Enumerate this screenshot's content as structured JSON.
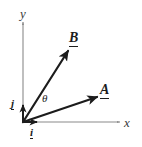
{
  "figure": {
    "width": 142,
    "height": 147,
    "background_color": "#ffffff"
  },
  "axes": {
    "origin": {
      "x": 23,
      "y": 122
    },
    "x_axis": {
      "label": "x",
      "color": "#8a8a8a",
      "from": {
        "x": 23,
        "y": 122
      },
      "to": {
        "x": 120,
        "y": 122
      }
    },
    "y_axis": {
      "label": "y",
      "color": "#8a8a8a",
      "from": {
        "x": 23,
        "y": 122
      },
      "to": {
        "x": 23,
        "y": 22
      }
    }
  },
  "vectors": [
    {
      "name": "A",
      "label": "A",
      "color": "#1c1c1c",
      "from": {
        "x": 23,
        "y": 122
      },
      "to": {
        "x": 97,
        "y": 97
      },
      "angle_from_x_deg": 18.6,
      "style": "bold-underlined"
    },
    {
      "name": "B",
      "label": "B",
      "color": "#1c1c1c",
      "from": {
        "x": 23,
        "y": 122
      },
      "to": {
        "x": 68,
        "y": 50
      },
      "angle_from_x_deg": 58.0,
      "style": "bold-underlined"
    }
  ],
  "unit_vectors": [
    {
      "name": "i",
      "label": "i",
      "color": "#1c1c1c",
      "from": {
        "x": 23,
        "y": 122
      },
      "to": {
        "x": 37,
        "y": 122
      },
      "direction": "x"
    },
    {
      "name": "j",
      "label": "j",
      "color": "#1c1c1c",
      "from": {
        "x": 23,
        "y": 122
      },
      "to": {
        "x": 23,
        "y": 104
      },
      "direction": "y"
    }
  ],
  "angle": {
    "symbol": "θ",
    "between": [
      "A",
      "B"
    ],
    "value_deg": 39.4,
    "position": {
      "x": 45,
      "y": 100
    }
  }
}
